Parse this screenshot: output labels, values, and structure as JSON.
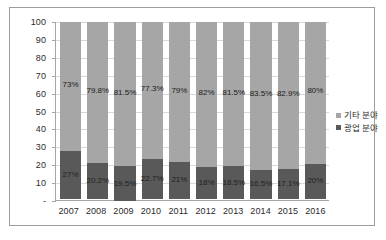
{
  "chart_data": {
    "type": "bar",
    "subtype": "stacked-100-percent",
    "title": "",
    "xlabel": "",
    "ylabel": "",
    "ylim": [
      0,
      100
    ],
    "grid": true,
    "legend_position": "right",
    "categories": [
      "2007",
      "2008",
      "2009",
      "2010",
      "2011",
      "2012",
      "2013",
      "2014",
      "2015",
      "2016"
    ],
    "series": [
      {
        "name": "기타 분야",
        "color": "#a6a6a6",
        "values": [
          73,
          79.8,
          81.5,
          77.3,
          79,
          82,
          81.5,
          83.5,
          82.9,
          80
        ],
        "labels": [
          "73%",
          "79.8%",
          "81.5%",
          "77.3%",
          "79%",
          "82%",
          "81.5%",
          "83.5%",
          "82.9%",
          "80%"
        ]
      },
      {
        "name": "광업 분야",
        "color": "#595959",
        "values": [
          27,
          20.2,
          19.5,
          22.7,
          21,
          18,
          18.5,
          16.5,
          17.1,
          20
        ],
        "labels": [
          "27%",
          "20.2%",
          "19.5%",
          "22.7%",
          "21%",
          "18%",
          "18.5%",
          "16.5%",
          "17.1%",
          "20%"
        ]
      }
    ],
    "y_ticks": [
      "100",
      "90",
      "80",
      "70",
      "60",
      "50",
      "40",
      "30",
      "20",
      "10",
      "-"
    ],
    "y_tick_values": [
      100,
      90,
      80,
      70,
      60,
      50,
      40,
      30,
      20,
      10,
      0
    ]
  },
  "legend": {
    "items": [
      {
        "label": "기타 분야",
        "color": "#a6a6a6"
      },
      {
        "label": "광업 분야",
        "color": "#595959"
      }
    ]
  },
  "colors": {
    "other_sector": "#a6a6a6",
    "mining_sector": "#595959",
    "gridline": "#d9d9d9",
    "axis": "#a6a6a6",
    "border": "#9d9d9d",
    "background": "#ffffff"
  }
}
